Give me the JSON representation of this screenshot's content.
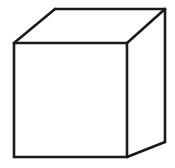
{
  "figure": {
    "name": "cube-line-drawing",
    "type": "line-drawing",
    "subject": "cube",
    "description": "Black outline drawing of a three-dimensional cube shown in oblique/parallel projection, drawn as a wireframe showing the front face, top face and right face.",
    "caption": "",
    "background_color": "#ffffff",
    "stroke_color": "#1a1a1a",
    "fill_color": "#ffffff",
    "stroke_width": 2.6,
    "canvas": {
      "width": 175,
      "height": 168
    },
    "projection": "oblique parallel projection, receding edges go up and to the right",
    "visible_faces": [
      "front",
      "top",
      "right"
    ],
    "hidden_edges_shown": false,
    "vertices": {
      "front_top_left": [
        14,
        43
      ],
      "front_top_right": [
        127,
        43
      ],
      "front_bottom_right": [
        127,
        157
      ],
      "front_bottom_left": [
        14,
        157
      ],
      "back_top_left": [
        55,
        9
      ],
      "back_top_right": [
        165,
        9
      ],
      "back_bottom_right": [
        165,
        142
      ]
    },
    "faces": {
      "front": {
        "label": "front-face",
        "points": "14,43 127,43 127,157 14,157"
      },
      "top": {
        "label": "top-face",
        "points": "14,43 55,9 165,9 127,43"
      },
      "right": {
        "label": "right-face",
        "points": "127,43 165,9 165,142 127,157"
      }
    },
    "edges": [
      {
        "label": "front-top-edge",
        "d": "M 14,43 L 127,43"
      },
      {
        "label": "front-right-edge",
        "d": "M 127,43 L 127,157"
      },
      {
        "label": "front-bottom-edge",
        "d": "M 127,157 L 14,157"
      },
      {
        "label": "front-left-edge",
        "d": "M 14,157 L 14,43"
      },
      {
        "label": "top-left-receding-edge",
        "d": "M 14,43 L 55,9"
      },
      {
        "label": "top-back-edge",
        "d": "M 55,9 L 165,9"
      },
      {
        "label": "top-right-receding-edge",
        "d": "M 127,43 L 165,9"
      },
      {
        "label": "back-right-vertical-edge",
        "d": "M 165,9 L 165,142"
      },
      {
        "label": "bottom-right-receding-edge",
        "d": "M 127,157 L 165,142"
      }
    ]
  }
}
